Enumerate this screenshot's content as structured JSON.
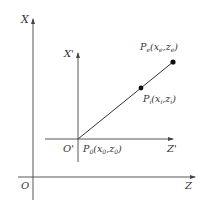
{
  "diagram": {
    "colors": {
      "line": "#444444",
      "text": "#333333",
      "point": "#111111",
      "background": "#ffffff"
    },
    "axes": {
      "main_x": {
        "label": "X"
      },
      "main_z": {
        "label": "Z"
      },
      "origin": {
        "label": "O"
      },
      "local_x": {
        "label": "X'"
      },
      "local_z": {
        "label": "Z'"
      },
      "local_origin": {
        "label": "O'"
      }
    },
    "points": {
      "p0": {
        "symbol": "P",
        "sub": "0",
        "coords": "(x0,z0)",
        "x_sub": "0",
        "z_sub": "0"
      },
      "pi": {
        "symbol": "P",
        "sub": "i",
        "coords": "(xi,zi)",
        "x_sub": "i",
        "z_sub": "i"
      },
      "pe": {
        "symbol": "P",
        "sub": "e",
        "coords": "(xe,ze)",
        "x_sub": "e",
        "z_sub": "e"
      }
    }
  }
}
